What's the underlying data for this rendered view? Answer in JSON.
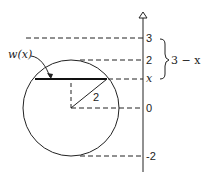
{
  "diagram": {
    "axis": {
      "ticks": [
        {
          "label": "3",
          "value": 3
        },
        {
          "label": "2",
          "value": 2
        },
        {
          "label": "x",
          "value": "x"
        },
        {
          "label": "0",
          "value": 0
        },
        {
          "label": "-2",
          "value": -2
        }
      ]
    },
    "circle": {
      "radius_label": "2"
    },
    "chord_label": "w(x)",
    "brace_label": "3 − x",
    "colors": {
      "stroke": "#222222",
      "background": "#ffffff"
    }
  }
}
